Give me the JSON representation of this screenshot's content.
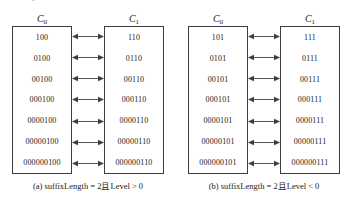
{
  "top_sliver_text": "··· ·· —₀· ·· — · ··· · · · ········ · ·· · ·· · ···· ··· · · ·",
  "panels": [
    {
      "id": "panel-a",
      "caption": "(a) suffixLength = 2且Level > 0",
      "columns": [
        {
          "id": "C0",
          "header_base": "C",
          "header_sub": "0",
          "values": [
            "100",
            "0100",
            "00100",
            "000100",
            "0000100",
            "00000100",
            "000000100"
          ]
        },
        {
          "id": "C1",
          "header_base": "C",
          "header_sub": "1",
          "values": [
            "110",
            "0110",
            "00110",
            "000110",
            "0000110",
            "00000110",
            "000000110"
          ]
        }
      ],
      "arrow_count": 7,
      "arrow_style": "double-headed"
    },
    {
      "id": "panel-b",
      "caption": "(b) suffixLength = 2且Level < 0",
      "columns": [
        {
          "id": "C0",
          "header_base": "C",
          "header_sub": "0",
          "values": [
            "101",
            "0101",
            "00101",
            "000101",
            "0000101",
            "00000101",
            "000000101"
          ]
        },
        {
          "id": "C1",
          "header_base": "C",
          "header_sub": "1",
          "values": [
            "111",
            "0111",
            "00111",
            "000111",
            "0000111",
            "00000111",
            "000000111"
          ]
        }
      ],
      "arrow_count": 7,
      "arrow_style": "double-headed"
    }
  ],
  "colors": {
    "box_border": "#3d3d3d",
    "arrow": "#555555",
    "text": "#1a1a1a",
    "background": "#ffffff"
  }
}
